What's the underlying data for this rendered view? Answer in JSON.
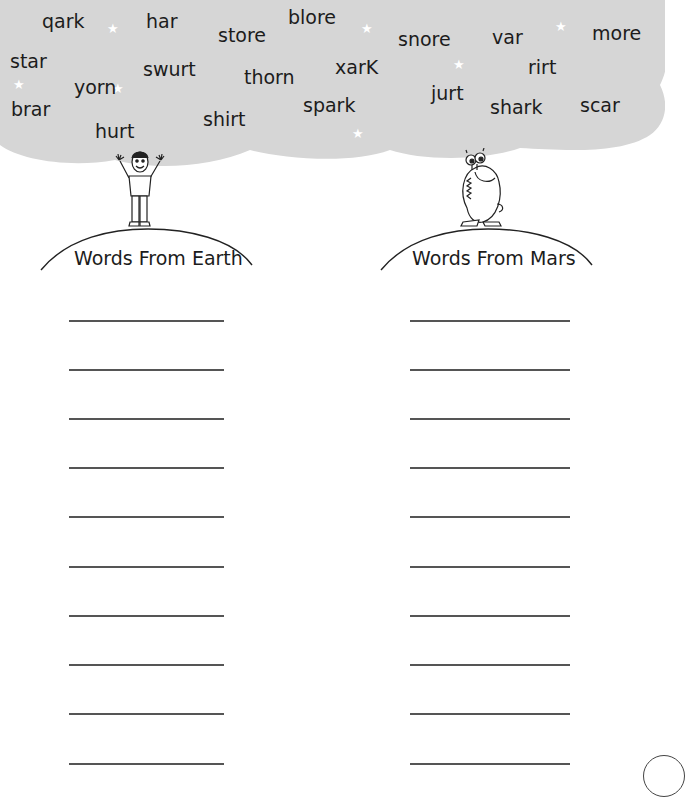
{
  "word_cloud": {
    "words": [
      {
        "text": "qark",
        "x": 42,
        "y": 10
      },
      {
        "text": "har",
        "x": 146,
        "y": 10
      },
      {
        "text": "store",
        "x": 218,
        "y": 24
      },
      {
        "text": "blore",
        "x": 288,
        "y": 6
      },
      {
        "text": "snore",
        "x": 398,
        "y": 28
      },
      {
        "text": "var",
        "x": 492,
        "y": 26
      },
      {
        "text": "more",
        "x": 592,
        "y": 22
      },
      {
        "text": "star",
        "x": 10,
        "y": 50
      },
      {
        "text": "swurt",
        "x": 143,
        "y": 58
      },
      {
        "text": "thorn",
        "x": 244,
        "y": 66
      },
      {
        "text": "xarK",
        "x": 335,
        "y": 56
      },
      {
        "text": "rirt",
        "x": 528,
        "y": 56
      },
      {
        "text": "yorn",
        "x": 74,
        "y": 76
      },
      {
        "text": "jurt",
        "x": 431,
        "y": 82
      },
      {
        "text": "brar",
        "x": 11,
        "y": 98
      },
      {
        "text": "spark",
        "x": 303,
        "y": 94
      },
      {
        "text": "shark",
        "x": 490,
        "y": 96
      },
      {
        "text": "scar",
        "x": 580,
        "y": 94
      },
      {
        "text": "shirt",
        "x": 203,
        "y": 108
      },
      {
        "text": "hurt",
        "x": 95,
        "y": 120
      }
    ]
  },
  "columns": [
    {
      "heading": "Words From Earth",
      "character": "boy-character",
      "lines": 10
    },
    {
      "heading": "Words From Mars",
      "character": "martian-character",
      "lines": 10
    }
  ]
}
